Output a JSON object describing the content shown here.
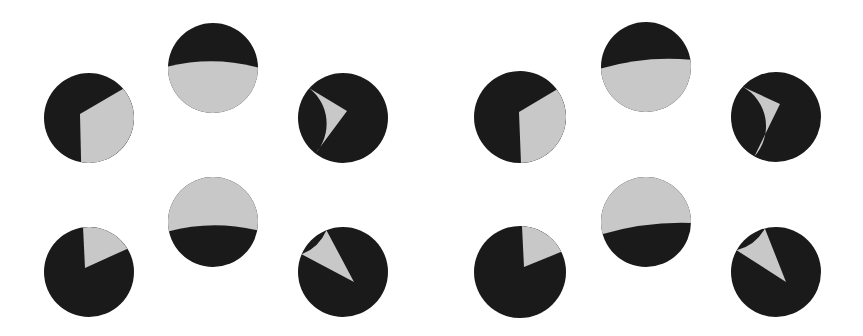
{
  "colors": {
    "dark": "#1a1a1a",
    "light": "#c8c8c8",
    "background": "#ffffff"
  },
  "panels": [
    {
      "name": "left-set",
      "pies": [
        {
          "id": "top-left",
          "cx": 89,
          "cy": 118,
          "r": 45,
          "kind": "wedge",
          "vertex": [
            80,
            114
          ],
          "arcStart": [
            123,
            89
          ],
          "arcEnd": [
            81,
            163
          ],
          "light_fraction": 0.36
        },
        {
          "id": "top-middle",
          "cx": 213,
          "cy": 68,
          "r": 45,
          "kind": "segment",
          "boundaryLeftY": 67,
          "boundaryRightY": 68,
          "controlY": 55,
          "lightSide": "bottom",
          "light_fraction": 0.62
        },
        {
          "id": "top-right",
          "cx": 343,
          "cy": 118,
          "r": 45,
          "kind": "wedge",
          "vertex": [
            347,
            111
          ],
          "arcStart": [
            309,
            88
          ],
          "arcEnd": [
            315,
            154
          ],
          "light_fraction": 0.24
        },
        {
          "id": "bottom-left",
          "cx": 89,
          "cy": 272,
          "r": 45,
          "kind": "wedge",
          "vertex": [
            85,
            268
          ],
          "arcStart": [
            83,
            227
          ],
          "arcEnd": [
            127,
            249
          ],
          "light_fraction": 0.16
        },
        {
          "id": "bottom-middle",
          "cx": 213,
          "cy": 222,
          "r": 45,
          "kind": "segment",
          "boundaryLeftY": 232,
          "boundaryRightY": 231,
          "controlY": 219,
          "lightSide": "top",
          "light_fraction": 0.57
        },
        {
          "id": "bottom-right",
          "cx": 343,
          "cy": 272,
          "r": 45,
          "kind": "wedge",
          "vertex": [
            354,
            282
          ],
          "arcStart": [
            326,
            229
          ],
          "arcEnd": [
            301,
            254
          ],
          "light_fraction": 0.09
        }
      ]
    },
    {
      "name": "right-set",
      "pies": [
        {
          "id": "top-left",
          "cx": 520,
          "cy": 117,
          "r": 46,
          "kind": "wedge",
          "vertex": [
            519,
            112
          ],
          "arcStart": [
            556,
            90
          ],
          "arcEnd": [
            521,
            163
          ],
          "light_fraction": 0.33
        },
        {
          "id": "top-middle",
          "cx": 646,
          "cy": 67,
          "r": 45,
          "kind": "segment",
          "boundaryLeftY": 69,
          "boundaryRightY": 60,
          "controlY": 55,
          "lightSide": "bottom",
          "light_fraction": 0.64
        },
        {
          "id": "top-right",
          "cx": 776,
          "cy": 117,
          "r": 45,
          "kind": "wedge",
          "vertex": [
            780,
            104
          ],
          "arcStart": [
            743,
            87
          ],
          "arcEnd": [
            754,
            157
          ],
          "light_fraction": 0.24
        },
        {
          "id": "bottom-left",
          "cx": 520,
          "cy": 272,
          "r": 46,
          "kind": "wedge",
          "vertex": [
            524,
            267
          ],
          "arcStart": [
            522,
            226
          ],
          "arcEnd": [
            561,
            252
          ],
          "light_fraction": 0.14
        },
        {
          "id": "bottom-middle",
          "cx": 646,
          "cy": 222,
          "r": 45,
          "kind": "segment",
          "boundaryLeftY": 235,
          "boundaryRightY": 223,
          "controlY": 221,
          "lightSide": "top",
          "light_fraction": 0.58
        },
        {
          "id": "bottom-right",
          "cx": 776,
          "cy": 272,
          "r": 45,
          "kind": "wedge",
          "vertex": [
            786,
            282
          ],
          "arcStart": [
            764,
            225
          ],
          "arcEnd": [
            738,
            251
          ],
          "light_fraction": 0.1
        }
      ]
    }
  ]
}
